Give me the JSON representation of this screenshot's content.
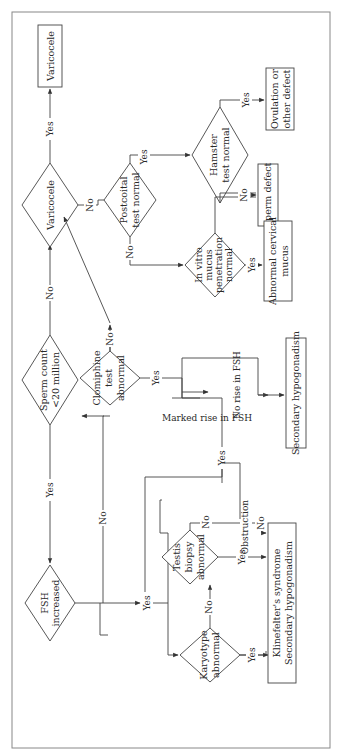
{
  "nodes": {
    "fsh": {
      "type": "decision",
      "lines": [
        "FSH",
        "increased"
      ]
    },
    "sperm_count": {
      "type": "decision",
      "lines": [
        "Sperm count",
        "<20 million"
      ]
    },
    "varicocele_q": {
      "type": "decision",
      "lines": [
        "Varicocele"
      ]
    },
    "varicocele_box": {
      "type": "outcome",
      "lines": [
        "Varicocele"
      ]
    },
    "clomiphine": {
      "type": "decision",
      "lines": [
        "Clomiphine",
        "test",
        "abnormal"
      ]
    },
    "postcoital": {
      "type": "decision",
      "lines": [
        "Postcoital",
        "test normal"
      ]
    },
    "hamster": {
      "type": "decision",
      "lines": [
        "Hamster",
        "test normal"
      ]
    },
    "ovulation_box": {
      "type": "outcome",
      "lines": [
        "Ovulation or",
        "other defect"
      ]
    },
    "in_vitro": {
      "type": "decision",
      "lines": [
        "In vitro",
        "mucus",
        "penetration",
        "normal"
      ]
    },
    "sperm_defect_box": {
      "type": "outcome",
      "lines": [
        "Sperm defect"
      ]
    },
    "cervical_box": {
      "type": "outcome",
      "lines": [
        "Abnormal cervical",
        "mucus"
      ]
    },
    "secondary_box": {
      "type": "outcome",
      "lines": [
        "Secondary hypogonadism"
      ]
    },
    "testis": {
      "type": "decision",
      "lines": [
        "Testis",
        "biopsy",
        "abnormal"
      ]
    },
    "karyotype": {
      "type": "decision",
      "lines": [
        "Karyotype",
        "abnormal"
      ]
    },
    "klinefelter_box": {
      "type": "outcome",
      "lines": [
        "Klinefelter's syndrome",
        "Secondary hypogonadism"
      ]
    }
  },
  "labels": {
    "yes": "Yes",
    "no": "No",
    "marked_rise": "Marked rise in FSH",
    "no_rise": "No rise in FSH",
    "obstruction": "Obstruction"
  },
  "colors": {
    "line": "#444444",
    "text": "#2a2a2a",
    "border": "#888888",
    "background": "#ffffff"
  }
}
